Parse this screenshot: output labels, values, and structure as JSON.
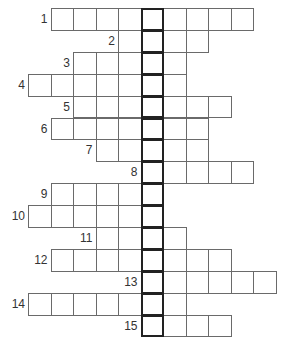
{
  "puzzle": {
    "type": "crossword",
    "highlighted_column": 5,
    "cell_width": 22.5,
    "row_height": 21.9,
    "origin_x": 28,
    "origin_y": 8,
    "colors": {
      "grid_line": "#6a6a6a",
      "key_column_border": "#222222",
      "number_text": "#333333"
    },
    "rows": [
      {
        "number": "1",
        "start_col": 1,
        "length": 9
      },
      {
        "number": "2",
        "start_col": 4,
        "length": 4
      },
      {
        "number": "3",
        "start_col": 2,
        "length": 5
      },
      {
        "number": "4",
        "start_col": 0,
        "length": 7
      },
      {
        "number": "5",
        "start_col": 2,
        "length": 7
      },
      {
        "number": "6",
        "start_col": 1,
        "length": 7
      },
      {
        "number": "7",
        "start_col": 3,
        "length": 5
      },
      {
        "number": "8",
        "start_col": 5,
        "length": 5
      },
      {
        "number": "9",
        "start_col": 1,
        "length": 5
      },
      {
        "number": "10",
        "start_col": 0,
        "length": 6
      },
      {
        "number": "11",
        "start_col": 3,
        "length": 4
      },
      {
        "number": "12",
        "start_col": 1,
        "length": 8
      },
      {
        "number": "13",
        "start_col": 5,
        "length": 6
      },
      {
        "number": "14",
        "start_col": 0,
        "length": 7
      },
      {
        "number": "15",
        "start_col": 5,
        "length": 4
      }
    ]
  }
}
